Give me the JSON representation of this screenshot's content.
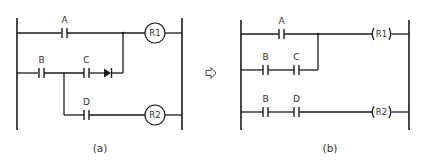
{
  "diagram_a": {
    "caption": "(a)",
    "contacts": {
      "a": "A",
      "b": "B",
      "c": "C",
      "d": "D"
    },
    "coils": {
      "r1": "R1",
      "r2": "R2"
    },
    "coil_style": "circle",
    "has_diode": true
  },
  "transform_arrow": {
    "icon": "right-arrow-outline-icon"
  },
  "diagram_b": {
    "caption": "(b)",
    "contacts": {
      "a": "A",
      "b1": "B",
      "c": "C",
      "b2": "B",
      "d": "D"
    },
    "coils": {
      "r1": "R1",
      "r2": "R2"
    },
    "coil_style": "parentheses"
  },
  "colors": {
    "line": "#1a1a1a",
    "text": "#333333",
    "background": "#ffffff"
  }
}
